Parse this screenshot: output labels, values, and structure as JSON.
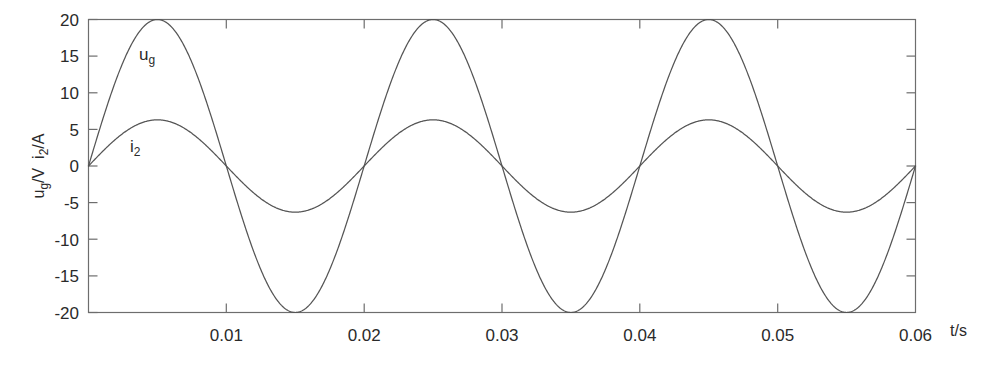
{
  "chart_data": {
    "type": "line",
    "title": "",
    "subtitle": "",
    "xlabel": "t/s",
    "ylabel": "ug/V  i2/A",
    "ylabel_parts": [
      {
        "base": "u",
        "sub": "g",
        "unit": "/V"
      },
      {
        "base": "i",
        "sub": "2",
        "unit": "/A"
      }
    ],
    "xlim": [
      0,
      0.06
    ],
    "ylim": [
      -20,
      20
    ],
    "xticks": [
      0,
      0.01,
      0.02,
      0.03,
      0.04,
      0.05,
      0.06
    ],
    "xtick_labels": [
      "",
      "0.01",
      "0.02",
      "0.03",
      "0.04",
      "0.05",
      "0.06"
    ],
    "yticks": [
      -20,
      -15,
      -10,
      -5,
      0,
      5,
      10,
      15,
      20
    ],
    "ytick_labels": [
      "-20",
      "-15",
      "-10",
      "-5",
      "0",
      "5",
      "10",
      "15",
      "20"
    ],
    "grid": false,
    "legend_position": "inline-annotation",
    "series": [
      {
        "name": "ug",
        "label_base": "u",
        "label_sub": "g",
        "description": "grid voltage, sinusoidal",
        "amplitude": 20,
        "unit": "V",
        "frequency_hz": 50,
        "period_s": 0.02,
        "phase_deg": 0,
        "color": "#555555",
        "annotation": {
          "t": 0.0043,
          "value": 15.3
        },
        "samples_t": [
          0,
          0.0025,
          0.005,
          0.0075,
          0.01,
          0.0125,
          0.015,
          0.0175,
          0.02,
          0.0225,
          0.025,
          0.0275,
          0.03,
          0.0325,
          0.035,
          0.0375,
          0.04,
          0.0425,
          0.045,
          0.0475,
          0.05,
          0.0525,
          0.055,
          0.0575,
          0.06
        ],
        "samples_v": [
          0,
          14.1,
          20,
          14.1,
          0,
          -14.1,
          -20,
          -14.1,
          0,
          14.1,
          20,
          14.1,
          0,
          -14.1,
          -20,
          -14.1,
          0,
          14.1,
          20,
          14.1,
          0,
          -14.1,
          -20,
          -14.1,
          0
        ]
      },
      {
        "name": "i2",
        "label_base": "i",
        "label_sub": "2",
        "description": "output current, sinusoidal",
        "amplitude": 6.3,
        "unit": "A",
        "frequency_hz": 50,
        "period_s": 0.02,
        "phase_deg": 0,
        "color": "#555555",
        "annotation": {
          "t": 0.0042,
          "value": 3.2
        },
        "samples_t": [
          0,
          0.0025,
          0.005,
          0.0075,
          0.01,
          0.0125,
          0.015,
          0.0175,
          0.02,
          0.0225,
          0.025,
          0.0275,
          0.03,
          0.0325,
          0.035,
          0.0375,
          0.04,
          0.0425,
          0.045,
          0.0475,
          0.05,
          0.0525,
          0.055,
          0.0575,
          0.06
        ],
        "samples_v": [
          0,
          4.45,
          6.3,
          4.45,
          0,
          -4.45,
          -6.3,
          -4.45,
          0,
          4.45,
          6.3,
          4.45,
          0,
          -4.45,
          -6.3,
          -4.45,
          0,
          4.45,
          6.3,
          4.45,
          0,
          -4.45,
          -6.3,
          -4.45,
          0
        ]
      }
    ],
    "colors": {
      "background": "#ffffff",
      "axis": "#6d6d6d",
      "text": "#2a2a2a",
      "series_ug": "#555555",
      "series_i2": "#555555"
    }
  }
}
